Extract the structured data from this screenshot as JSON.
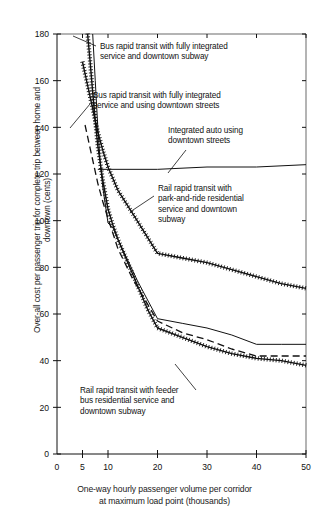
{
  "chart_data": {
    "type": "line",
    "title": "",
    "xlabel": "One-way hourly passenger volume per corridor at maximum load point (thousands)",
    "ylabel": "Over-all cost per passenger trip for complete trip between home and downtown (cents)",
    "xtick_labels": [
      "0",
      "5",
      "10",
      "20",
      "30",
      "40",
      "50"
    ],
    "xtick_values": [
      0,
      5,
      10,
      20,
      30,
      40,
      50
    ],
    "ytick_labels": [
      "0",
      "20",
      "40",
      "60",
      "80",
      "100",
      "120",
      "140",
      "160",
      "180"
    ],
    "ytick_values": [
      0,
      20,
      40,
      60,
      80,
      100,
      120,
      140,
      160,
      180
    ],
    "xlim": [
      0,
      50
    ],
    "ylim": [
      0,
      180
    ],
    "grid": false,
    "legend_position": "annotations-inline",
    "series": [
      {
        "name": "Bus rapid transit with fully integrated service and downtown subway",
        "style": "cross-hatched",
        "x": [
          5,
          5.5,
          6,
          6.5,
          7,
          7.5,
          8,
          9,
          10,
          12,
          15,
          20,
          25,
          30,
          35,
          40,
          45,
          50
        ],
        "y": [
          168,
          163,
          158,
          153,
          148,
          143,
          138,
          130,
          123,
          113,
          103,
          86,
          84,
          82,
          79,
          76,
          73,
          71
        ]
      },
      {
        "name": "Bus rapid transit with fully integrated service and using downtown streets",
        "style": "dashed",
        "x": [
          5.5,
          6,
          6.5,
          7,
          7.5,
          8,
          9,
          10,
          12,
          15,
          20,
          25,
          30,
          35,
          40,
          45,
          50
        ],
        "y": [
          141,
          136,
          131,
          126,
          121,
          116,
          108,
          101,
          88,
          75,
          57,
          52,
          49,
          45,
          42,
          42,
          42
        ]
      },
      {
        "name": "Integrated auto using downtown streets",
        "style": "solid",
        "x": [
          8,
          20,
          30,
          40,
          50
        ],
        "y": [
          122,
          122,
          123,
          123,
          124
        ]
      },
      {
        "name": "Rail rapid transit with park-and-ride residential service and downtown subway",
        "style": "solid",
        "x": [
          7,
          7.5,
          8,
          8.5,
          9,
          10,
          11,
          12,
          14,
          16,
          18,
          20,
          25,
          30,
          35,
          40,
          45,
          50
        ],
        "y": [
          180,
          160,
          140,
          124,
          114,
          99,
          97,
          92,
          83,
          74,
          66,
          58,
          56,
          54,
          51,
          47,
          47,
          47
        ]
      },
      {
        "name": "Rail rapid transit with feeder bus residential service and downtown subway",
        "style": "cross-hatched",
        "x": [
          6,
          6.5,
          7,
          7.5,
          8,
          9,
          10,
          11,
          12,
          14,
          16,
          18,
          20,
          25,
          30,
          35,
          40,
          45,
          50
        ],
        "y": [
          180,
          168,
          155,
          143,
          132,
          117,
          105,
          98,
          92,
          82,
          72,
          62,
          54,
          50,
          46,
          43,
          41,
          40,
          38
        ]
      }
    ],
    "annotations": [
      {
        "id": "bus-rapid-subway",
        "text": "Bus rapid transit with fully integrated\nservice and downtown subway",
        "x": 100,
        "y": 42
      },
      {
        "id": "bus-rapid-streets",
        "text": "Bus rapid transit with fully integrated\nservice and using downtown streets",
        "x": 93,
        "y": 91
      },
      {
        "id": "integrated-auto",
        "text": "Integrated auto using\ndowntown streets",
        "x": 168,
        "y": 126
      },
      {
        "id": "rail-park-and-ride",
        "text": "Rail rapid transit with\npark-and-ride residential\nservice and downtown\nsubway",
        "x": 158,
        "y": 184
      },
      {
        "id": "rail-feeder-bus",
        "text": "Rail rapid transit with feeder\nbus residential service and\ndowntown subway",
        "x": 80,
        "y": 386
      }
    ]
  },
  "colors": {
    "ink": "#111111",
    "background": "#ffffff"
  }
}
